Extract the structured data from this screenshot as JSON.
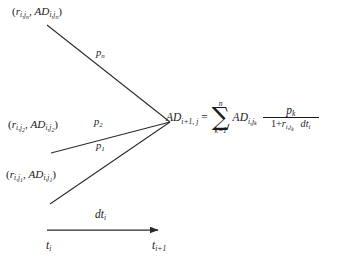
{
  "diagram": {
    "type": "tree-transition-diagram",
    "background_color": "#ffffff",
    "line_color": "#2a2a2a"
  },
  "nodes": [
    {
      "id": "node-n",
      "label_plain": "(r_{i,j_n}, AD_{i,j_n})",
      "rate_symbol": "r",
      "rate_sub": "i,j",
      "rate_sub2": "n",
      "ad_symbol": "AD",
      "ad_sub": "i,j",
      "ad_sub2": "n",
      "position": "top-left"
    },
    {
      "id": "node-2",
      "label_plain": "(r_{i,j_2}, AD_{i,j_2})",
      "rate_symbol": "r",
      "rate_sub": "i,j",
      "rate_sub2": "2",
      "ad_symbol": "AD",
      "ad_sub": "i,j",
      "ad_sub2": "2",
      "position": "middle-left"
    },
    {
      "id": "node-1",
      "label_plain": "(r_{i,j_1}, AD_{i,j_1})",
      "rate_symbol": "r",
      "rate_sub": "i,j",
      "rate_sub2": "1",
      "ad_symbol": "AD",
      "ad_sub": "i,j",
      "ad_sub2": "1",
      "position": "bottom-left"
    }
  ],
  "edges": [
    {
      "id": "edge-n",
      "label_plain": "p_n",
      "symbol": "p",
      "subscript": "n"
    },
    {
      "id": "edge-2",
      "label_plain": "p_2",
      "symbol": "p",
      "subscript": "2"
    },
    {
      "id": "edge-1",
      "label_plain": "p_1",
      "symbol": "p",
      "subscript": "1"
    }
  ],
  "equation": {
    "full_plain": "AD_{i+1,j} = sum_{k=1}^{n} AD_{i,j_k} * p_k / (1+r_{i,j_k}) * dt_i",
    "lhs_symbol": "AD",
    "lhs_sub": "i+1, j",
    "equals": "=",
    "sum_upper": "n",
    "sum_lower": "k=1",
    "sigma_glyph": "∑",
    "summand_symbol": "AD",
    "summand_sub": "i,j",
    "summand_sub2": "k",
    "numerator_symbol": "p",
    "numerator_sub": "k",
    "denominator_prefix": "1+",
    "denominator_symbol": "r",
    "denominator_sub": "i,j",
    "denominator_sub2": "k",
    "trailing_symbol": "dt",
    "trailing_sub": "i"
  },
  "time_axis": {
    "interval_symbol": "dt",
    "interval_sub": "i",
    "start_symbol": "t",
    "start_sub": "i",
    "end_symbol": "t",
    "end_sub": "i+1",
    "arrow_direction": "right"
  }
}
